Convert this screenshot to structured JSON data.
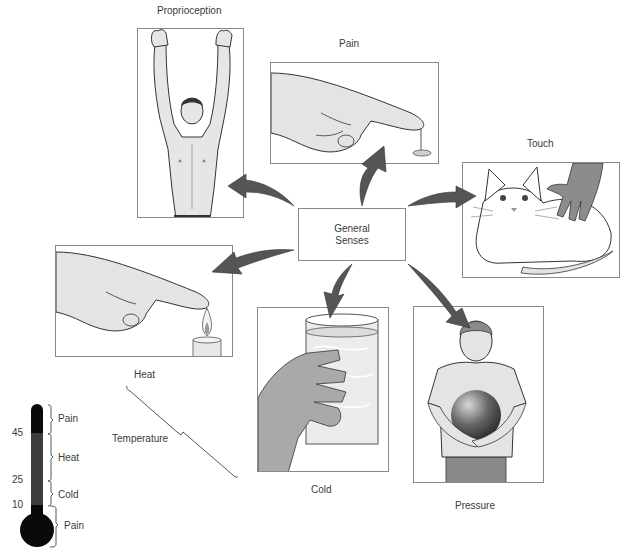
{
  "center": {
    "line1": "General",
    "line2": "Senses"
  },
  "panels": [
    {
      "id": "proprioception",
      "label": "Proprioception"
    },
    {
      "id": "pain",
      "label": "Pain"
    },
    {
      "id": "touch",
      "label": "Touch"
    },
    {
      "id": "heat",
      "label": ""
    },
    {
      "id": "cold",
      "label": "Cold"
    },
    {
      "id": "pressure",
      "label": "Pressure"
    }
  ],
  "temperature_bracket": {
    "top_label": "Heat",
    "side_label": "Temperature"
  },
  "thermometer": {
    "ticks": [
      {
        "value": "45"
      },
      {
        "value": "25"
      },
      {
        "value": "10"
      }
    ],
    "ranges": [
      {
        "label": "Pain"
      },
      {
        "label": "Heat"
      },
      {
        "label": "Cold"
      },
      {
        "label": "Pain"
      }
    ],
    "colors": {
      "dark": "#0a0a0a",
      "mid": "#3c3c3c"
    }
  },
  "colors": {
    "border": "#8a8a8a",
    "arrow_dark": "#3a3a3a",
    "arrow_light": "#d8d8d8",
    "skin": "#e4e4e4"
  }
}
